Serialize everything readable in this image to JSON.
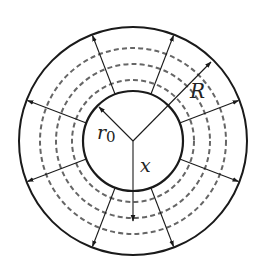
{
  "diagram": {
    "type": "concentric-circles-radial-flow",
    "center": [
      133,
      141
    ],
    "outer_circle": {
      "radius": 114,
      "stroke": "#1a1a1a",
      "style": "solid"
    },
    "inner_circle": {
      "radius": 50,
      "stroke": "#1a1a1a",
      "style": "solid"
    },
    "dashed_circles": [
      {
        "radius": 61,
        "stroke": "#666666"
      },
      {
        "radius": 77,
        "stroke": "#666666"
      },
      {
        "radius": 93,
        "stroke": "#666666"
      }
    ],
    "radial_arrow_angles_deg": [
      -111,
      -69,
      -21,
      21,
      69,
      111,
      159,
      201
    ],
    "labels": {
      "outer_radius": "R",
      "inner_radius": "r",
      "inner_radius_subscript": "0",
      "distance": "x"
    },
    "colors": {
      "solid": "#1a1a1a",
      "dashed": "#666666",
      "background": "#ffffff"
    }
  }
}
